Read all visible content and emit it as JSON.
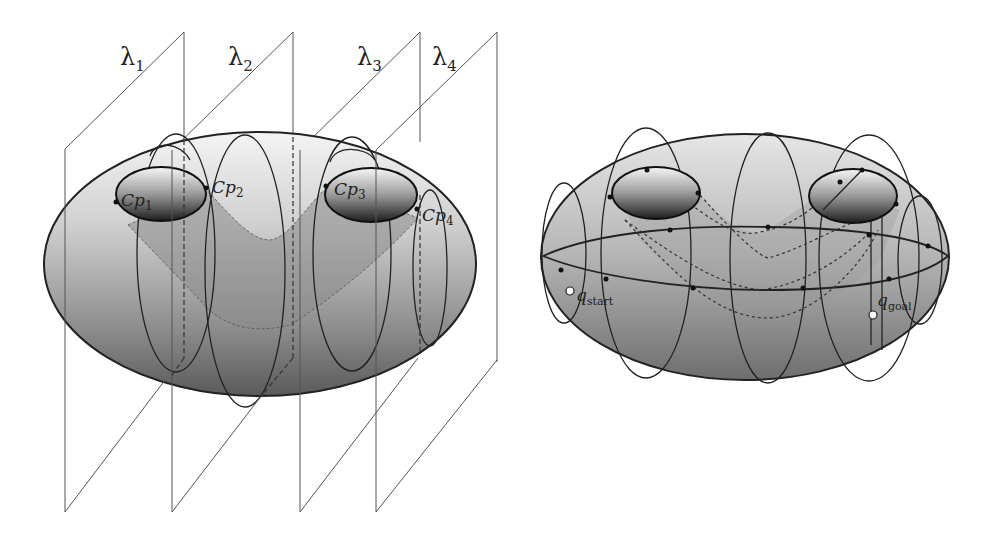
{
  "figure": {
    "left_panel": {
      "description": "Ellipsoidal configuration space sliced by four parallel planes",
      "planes": [
        {
          "name": "lambda",
          "sub": "1"
        },
        {
          "name": "lambda",
          "sub": "2"
        },
        {
          "name": "lambda",
          "sub": "3"
        },
        {
          "name": "lambda",
          "sub": "4"
        }
      ],
      "critical_points": [
        {
          "base": "Cp",
          "sub": "1"
        },
        {
          "base": "Cp",
          "sub": "2"
        },
        {
          "base": "Cp",
          "sub": "3"
        },
        {
          "base": "Cp",
          "sub": "4"
        }
      ]
    },
    "right_panel": {
      "description": "Roadmap on ellipsoid with two obstacles, start and goal",
      "start": {
        "base": "q",
        "sub": "start"
      },
      "goal": {
        "base": "q",
        "sub": "goal"
      }
    },
    "glyphs": {
      "lambda": "λ"
    },
    "colors": {
      "line": "#222222",
      "plane": "#555555",
      "shade": "#8a8a8a"
    }
  }
}
